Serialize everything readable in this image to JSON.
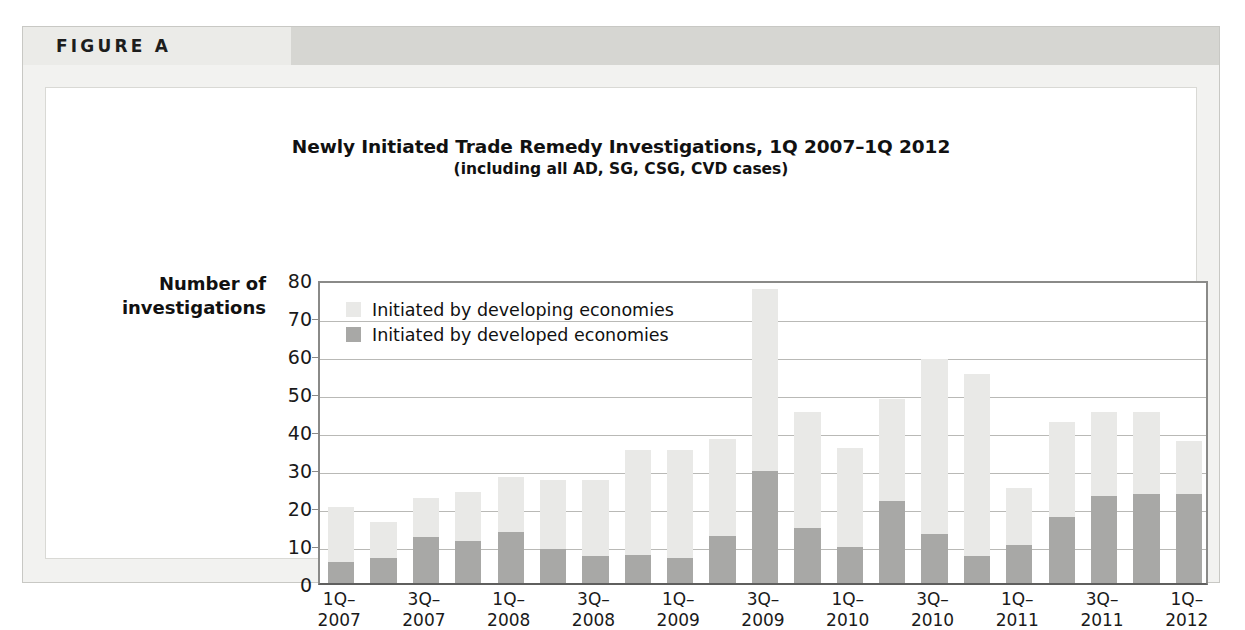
{
  "figure": {
    "label": "FIGURE A"
  },
  "chart_data": {
    "type": "bar",
    "stacked": true,
    "title": "Newly Initiated Trade Remedy Investigations, 1Q 2007–1Q 2012",
    "subtitle": "(including all AD, SG, CSG, CVD cases)",
    "xlabel": "",
    "ylabel": "Number of\ninvestigations",
    "ylabel_line1": "Number of",
    "ylabel_line2": "investigations",
    "ylim": [
      0,
      80
    ],
    "yticks": [
      0,
      10,
      20,
      30,
      40,
      50,
      60,
      70,
      80
    ],
    "ytick_labels": [
      "0",
      "10",
      "20",
      "30",
      "40",
      "50",
      "60",
      "70",
      "80"
    ],
    "grid": true,
    "legend_position": "top-left-inside",
    "colors": {
      "developing": "#e9e9e7",
      "developed": "#a8a8a6",
      "axis": "#8a8a88",
      "grid": "#b9b9b6",
      "text": "#111111",
      "header_band": "#d6d6d2",
      "panel": "#f2f2f0"
    },
    "categories": [
      "1Q-2007",
      "2Q-2007",
      "3Q-2007",
      "4Q-2007",
      "1Q-2008",
      "2Q-2008",
      "3Q-2008",
      "4Q-2008",
      "1Q-2009",
      "2Q-2009",
      "3Q-2009",
      "4Q-2009",
      "1Q-2010",
      "2Q-2010",
      "3Q-2010",
      "4Q-2010",
      "1Q-2011",
      "2Q-2011",
      "3Q-2011",
      "4Q-2011",
      "1Q-2012"
    ],
    "tick_labels": [
      "1Q–\n2007",
      "",
      "3Q–\n2007",
      "",
      "1Q–\n2008",
      "",
      "3Q–\n2008",
      "",
      "1Q–\n2009",
      "",
      "3Q–\n2009",
      "",
      "1Q–\n2010",
      "",
      "3Q–\n2010",
      "",
      "1Q–\n2011",
      "",
      "3Q–\n2011",
      "",
      "1Q–\n2012"
    ],
    "series": [
      {
        "name": "Initiated by developed economies",
        "key": "developed",
        "color": "#a8a8a6",
        "values": [
          5.5,
          6.5,
          12,
          11,
          13.5,
          9,
          7,
          7.5,
          6.5,
          12.5,
          29.5,
          14.5,
          9.5,
          21.5,
          13,
          7,
          10,
          17.5,
          23,
          23.5,
          23.5
        ]
      },
      {
        "name": "Initiated by developing economies",
        "key": "developing",
        "color": "#e9e9e7",
        "values": [
          14.5,
          9.5,
          10.5,
          13,
          14.5,
          18,
          20,
          27.5,
          28.5,
          25.5,
          48,
          30.5,
          26,
          27,
          46,
          48,
          15,
          25,
          22,
          21.5,
          14
        ]
      }
    ],
    "totals": [
      20,
      16,
      22.5,
      24,
      28,
      27,
      27,
      35,
      35,
      38,
      77.5,
      45,
      35.5,
      48.5,
      59,
      55,
      25,
      42.5,
      45,
      45,
      37.5
    ]
  },
  "legend": {
    "items": [
      {
        "label": "Initiated by developing economies",
        "key": "developing"
      },
      {
        "label": "Initiated by developed economies",
        "key": "developed"
      }
    ]
  }
}
